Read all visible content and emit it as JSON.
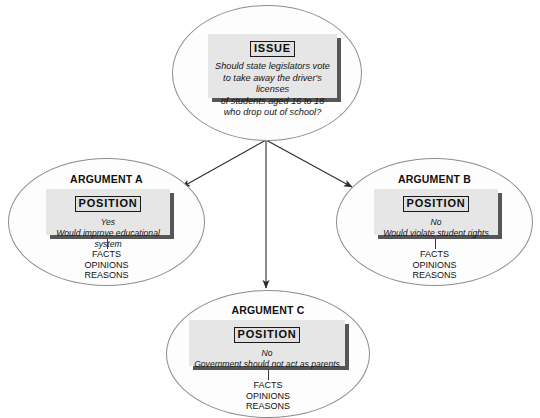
{
  "diagram": {
    "colors": {
      "background": "#ffffff",
      "ellipse_stroke": "#8d8d8d",
      "panel_fill": "#e6e6e6",
      "panel_shadow": "#565656",
      "arrow": "#2b2b2b",
      "text": "#111111"
    }
  },
  "issue_node": {
    "panel": {
      "heading": "ISSUE",
      "lines": [
        "Should state legislators vote",
        "to take away the driver's licenses",
        "of students aged 16 to 18",
        "who drop out of school?"
      ]
    }
  },
  "arguments": [
    {
      "title": "ARGUMENT A",
      "panel": {
        "heading": "POSITION",
        "lines": [
          "Yes",
          "Would improve educational system"
        ]
      },
      "support": [
        "FACTS",
        "OPINIONS",
        "REASONS"
      ]
    },
    {
      "title": "ARGUMENT B",
      "panel": {
        "heading": "POSITION",
        "lines": [
          "No",
          "Would violate student rights"
        ]
      },
      "support": [
        "FACTS",
        "OPINIONS",
        "REASONS"
      ]
    },
    {
      "title": "ARGUMENT C",
      "panel": {
        "heading": "POSITION",
        "lines": [
          "No",
          "Government should not act as parents"
        ]
      },
      "support": [
        "FACTS",
        "OPINIONS",
        "REASONS"
      ]
    }
  ],
  "connectors": [
    {
      "name": "issue-to-argument-a",
      "from": "issue_node",
      "to": "argument-a"
    },
    {
      "name": "issue-to-argument-c",
      "from": "issue_node",
      "to": "argument-c"
    },
    {
      "name": "issue-to-argument-b",
      "from": "issue_node",
      "to": "argument-b"
    }
  ]
}
